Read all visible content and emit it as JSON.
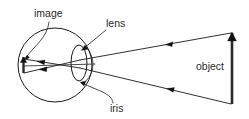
{
  "figure": {
    "kind": "optics-ray-diagram",
    "background_color": "#ffffff",
    "ink_color": "#1a1a1a"
  },
  "labels": {
    "image": "image",
    "lens": "lens",
    "iris": "iris",
    "object": "object"
  },
  "geometry": {
    "eye": {
      "cx": 55,
      "cy": 65,
      "rx": 37,
      "ry": 37
    },
    "lens": {
      "cx": 79,
      "cy": 63,
      "rx": 8,
      "ry": 18
    },
    "image_arrow": {
      "x": 23,
      "y_top": 57,
      "y_bottom": 73
    },
    "object_arrow": {
      "x": 232,
      "y_top": 33,
      "y_bottom": 104
    },
    "optical_axis": {
      "y": 65
    }
  },
  "label_positions": {
    "image": {
      "x": 34,
      "y": 17
    },
    "lens": {
      "x": 106,
      "y": 27
    },
    "iris": {
      "x": 110,
      "y": 112
    },
    "object": {
      "x": 196,
      "y": 70
    }
  },
  "rays": [
    {
      "name": "upper-ray",
      "from_object_y": 33,
      "to_image_y": 73,
      "arrow_direction": "left"
    },
    {
      "name": "lower-ray",
      "from_object_y": 104,
      "to_image_y": 58,
      "arrow_direction": "left"
    }
  ]
}
